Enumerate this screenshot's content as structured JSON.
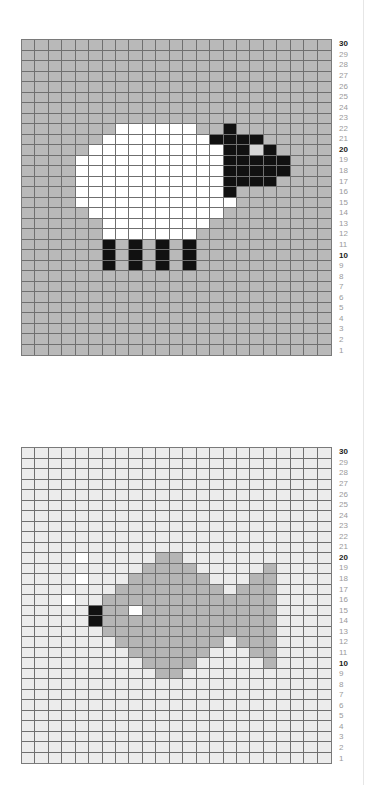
{
  "chart_data": [
    {
      "type": "heatmap",
      "title": "Sheep chart",
      "columns": 23,
      "rows": 30,
      "row_labels": [
        30,
        29,
        28,
        27,
        26,
        25,
        24,
        23,
        22,
        21,
        20,
        19,
        18,
        17,
        16,
        15,
        14,
        13,
        12,
        11,
        10,
        9,
        8,
        7,
        6,
        5,
        4,
        3,
        2,
        1
      ],
      "bold_row_labels": [
        30,
        20,
        10
      ],
      "background": "#b9b9b9",
      "palette": {
        "white": "#ffffff",
        "black": "#111111",
        "eye": "#d6d6d6"
      },
      "cells": [
        {
          "row": 22,
          "cols": [
            [
              7,
              12
            ]
          ],
          "color": "white"
        },
        {
          "row": 22,
          "cols": [
            [
              15,
              15
            ]
          ],
          "color": "black"
        },
        {
          "row": 21,
          "cols": [
            [
              6,
              13
            ]
          ],
          "color": "white"
        },
        {
          "row": 21,
          "cols": [
            [
              14,
              17
            ]
          ],
          "color": "black"
        },
        {
          "row": 20,
          "cols": [
            [
              5,
              14
            ]
          ],
          "color": "white"
        },
        {
          "row": 20,
          "cols": [
            [
              15,
              16
            ],
            [
              18,
              18
            ]
          ],
          "color": "black"
        },
        {
          "row": 20,
          "cols": [
            [
              17,
              17
            ]
          ],
          "color": "eye"
        },
        {
          "row": 19,
          "cols": [
            [
              4,
              14
            ]
          ],
          "color": "white"
        },
        {
          "row": 19,
          "cols": [
            [
              15,
              19
            ]
          ],
          "color": "black"
        },
        {
          "row": 18,
          "cols": [
            [
              4,
              14
            ]
          ],
          "color": "white"
        },
        {
          "row": 18,
          "cols": [
            [
              15,
              19
            ]
          ],
          "color": "black"
        },
        {
          "row": 17,
          "cols": [
            [
              4,
              14
            ]
          ],
          "color": "white"
        },
        {
          "row": 17,
          "cols": [
            [
              15,
              18
            ]
          ],
          "color": "black"
        },
        {
          "row": 16,
          "cols": [
            [
              4,
              14
            ]
          ],
          "color": "white"
        },
        {
          "row": 16,
          "cols": [
            [
              15,
              15
            ]
          ],
          "color": "black"
        },
        {
          "row": 15,
          "cols": [
            [
              4,
              15
            ]
          ],
          "color": "white"
        },
        {
          "row": 14,
          "cols": [
            [
              5,
              14
            ]
          ],
          "color": "white"
        },
        {
          "row": 13,
          "cols": [
            [
              6,
              13
            ]
          ],
          "color": "white"
        },
        {
          "row": 12,
          "cols": [
            [
              6,
              12
            ]
          ],
          "color": "white"
        },
        {
          "row": 11,
          "cols": [
            [
              6,
              6
            ],
            [
              8,
              8
            ],
            [
              10,
              10
            ],
            [
              12,
              12
            ]
          ],
          "color": "black"
        },
        {
          "row": 10,
          "cols": [
            [
              6,
              6
            ],
            [
              8,
              8
            ],
            [
              10,
              10
            ],
            [
              12,
              12
            ]
          ],
          "color": "black"
        },
        {
          "row": 9,
          "cols": [
            [
              6,
              6
            ],
            [
              8,
              8
            ],
            [
              10,
              10
            ],
            [
              12,
              12
            ]
          ],
          "color": "black"
        }
      ]
    },
    {
      "type": "heatmap",
      "title": "Fish chart",
      "columns": 23,
      "rows": 30,
      "row_labels": [
        30,
        29,
        28,
        27,
        26,
        25,
        24,
        23,
        22,
        21,
        20,
        19,
        18,
        17,
        16,
        15,
        14,
        13,
        12,
        11,
        10,
        9,
        8,
        7,
        6,
        5,
        4,
        3,
        2,
        1
      ],
      "bold_row_labels": [
        30,
        20,
        10
      ],
      "background": "#ececec",
      "palette": {
        "gray": "#b5b5b5",
        "white": "#ffffff",
        "black": "#111111"
      },
      "cells": [
        {
          "row": 20,
          "cols": [
            [
              4,
              4
            ]
          ],
          "color": "white"
        },
        {
          "row": 20,
          "cols": [
            [
              10,
              11
            ]
          ],
          "color": "gray"
        },
        {
          "row": 19,
          "cols": [
            [
              9,
              12
            ],
            [
              18,
              18
            ]
          ],
          "color": "gray"
        },
        {
          "row": 18,
          "cols": [
            [
              4,
              4
            ]
          ],
          "color": "white"
        },
        {
          "row": 18,
          "cols": [
            [
              8,
              13
            ],
            [
              17,
              18
            ]
          ],
          "color": "gray"
        },
        {
          "row": 17,
          "cols": [
            [
              7,
              14
            ],
            [
              16,
              18
            ]
          ],
          "color": "gray"
        },
        {
          "row": 16,
          "cols": [
            [
              3,
              3
            ]
          ],
          "color": "white"
        },
        {
          "row": 16,
          "cols": [
            [
              6,
              18
            ]
          ],
          "color": "gray"
        },
        {
          "row": 15,
          "cols": [
            [
              5,
              5
            ]
          ],
          "color": "black"
        },
        {
          "row": 15,
          "cols": [
            [
              6,
              7
            ],
            [
              9,
              18
            ]
          ],
          "color": "gray"
        },
        {
          "row": 15,
          "cols": [
            [
              8,
              8
            ]
          ],
          "color": "white"
        },
        {
          "row": 14,
          "cols": [
            [
              5,
              5
            ]
          ],
          "color": "black"
        },
        {
          "row": 14,
          "cols": [
            [
              6,
              18
            ]
          ],
          "color": "gray"
        },
        {
          "row": 13,
          "cols": [
            [
              6,
              18
            ]
          ],
          "color": "gray"
        },
        {
          "row": 12,
          "cols": [
            [
              7,
              14
            ],
            [
              16,
              18
            ]
          ],
          "color": "gray"
        },
        {
          "row": 11,
          "cols": [
            [
              8,
              13
            ],
            [
              17,
              18
            ]
          ],
          "color": "gray"
        },
        {
          "row": 10,
          "cols": [
            [
              9,
              12
            ],
            [
              18,
              18
            ]
          ],
          "color": "gray"
        },
        {
          "row": 9,
          "cols": [
            [
              10,
              11
            ]
          ],
          "color": "gray"
        }
      ]
    }
  ],
  "charts": [
    {
      "name": "sheep-chart",
      "top": 39
    },
    {
      "name": "fish-chart",
      "top": 447
    }
  ]
}
